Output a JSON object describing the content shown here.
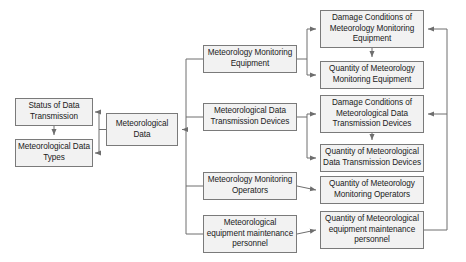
{
  "diagram": {
    "type": "hierarchical-flowchart",
    "colors": {
      "node_fill": "#f2f2f2",
      "node_border": "#7a7a7a",
      "connector": "#6e6e6e",
      "text": "#1a1a1a",
      "background": "#ffffff"
    },
    "nodes": {
      "status_of_data_transmission": {
        "label": "Status of Data Transmission",
        "column": "left-detail",
        "x": 15,
        "y": 98,
        "w": 78,
        "h": 28
      },
      "meteorological_data_types": {
        "label": "Meteorological Data Types",
        "column": "left-detail",
        "x": 15,
        "y": 139,
        "w": 78,
        "h": 28
      },
      "meteorological_data": {
        "label": "Meteorological Data",
        "column": "root",
        "x": 106,
        "y": 113,
        "w": 72,
        "h": 33
      },
      "meteorology_monitoring_equipment": {
        "label": "Meteorology Monitoring Equipment",
        "column": "category",
        "x": 203,
        "y": 45,
        "w": 94,
        "h": 28
      },
      "meteorological_data_transmission_devices": {
        "label": "Meteorological Data Transmission Devices",
        "column": "category",
        "x": 203,
        "y": 103,
        "w": 94,
        "h": 28
      },
      "meteorology_monitoring_operators": {
        "label": "Meteorology Monitoring Operators",
        "column": "category",
        "x": 203,
        "y": 172,
        "w": 94,
        "h": 28
      },
      "meteorological_equipment_maintenance_personnel": {
        "label": "Meteorological equipment maintenance personnel",
        "column": "category",
        "x": 203,
        "y": 215,
        "w": 94,
        "h": 38
      },
      "damage_conditions_of_meteorology_monitoring_equipment": {
        "label": "Damage Conditions of Meteorology Monitoring Equipment",
        "column": "attribute",
        "x": 320,
        "y": 10,
        "w": 104,
        "h": 38
      },
      "quantity_of_meteorology_monitoring_equipment": {
        "label": "Quantity of Meteorology Monitoring Equipment",
        "column": "attribute",
        "x": 320,
        "y": 61,
        "w": 104,
        "h": 28
      },
      "damage_conditions_of_meteorological_data_transmission_devices": {
        "label": "Damage Conditions of Meteorological Data Transmission Devices",
        "column": "attribute",
        "x": 320,
        "y": 95,
        "w": 104,
        "h": 38
      },
      "quantity_of_meteorological_data_transmission_devices": {
        "label": "Quantity of Meteorological Data Transmission Devices",
        "column": "attribute",
        "x": 320,
        "y": 144,
        "w": 104,
        "h": 28
      },
      "quantity_of_meteorology_monitoring_operators": {
        "label": "Quantity of Meteorology Monitoring Operators",
        "column": "attribute",
        "x": 320,
        "y": 176,
        "w": 104,
        "h": 28
      },
      "quantity_of_meteorological_equipment_maintenance_personnel": {
        "label": "Quantity of Meteorological equipment maintenance personnel",
        "column": "attribute",
        "x": 320,
        "y": 211,
        "w": 104,
        "h": 38
      }
    },
    "edges": [
      {
        "from": "meteorological_data",
        "to": "status_of_data_transmission",
        "style": "orthogonal-arrow"
      },
      {
        "from": "meteorological_data",
        "to": "meteorological_data_types",
        "style": "orthogonal-arrow"
      },
      {
        "from": "status_of_data_transmission",
        "to": "meteorological_data_types",
        "style": "vertical-arrow"
      },
      {
        "from": "meteorology_monitoring_equipment",
        "to": "meteorological_data",
        "style": "spine-arrow"
      },
      {
        "from": "meteorological_data_transmission_devices",
        "to": "meteorological_data",
        "style": "spine-arrow"
      },
      {
        "from": "meteorology_monitoring_operators",
        "to": "meteorological_data",
        "style": "spine-arrow"
      },
      {
        "from": "meteorological_equipment_maintenance_personnel",
        "to": "meteorological_data",
        "style": "spine-arrow"
      },
      {
        "from": "meteorology_monitoring_equipment",
        "to": "damage_conditions_of_meteorology_monitoring_equipment",
        "style": "branch-arrow"
      },
      {
        "from": "meteorology_monitoring_equipment",
        "to": "quantity_of_meteorology_monitoring_equipment",
        "style": "branch-arrow"
      },
      {
        "from": "meteorological_data_transmission_devices",
        "to": "damage_conditions_of_meteorological_data_transmission_devices",
        "style": "branch-arrow"
      },
      {
        "from": "meteorological_data_transmission_devices",
        "to": "quantity_of_meteorological_data_transmission_devices",
        "style": "branch-arrow"
      },
      {
        "from": "meteorology_monitoring_operators",
        "to": "quantity_of_meteorology_monitoring_operators",
        "style": "direct-arrow"
      },
      {
        "from": "meteorological_equipment_maintenance_personnel",
        "to": "quantity_of_meteorological_equipment_maintenance_personnel",
        "style": "direct-arrow"
      },
      {
        "from": "damage_conditions_of_meteorology_monitoring_equipment",
        "to": "quantity_of_meteorology_monitoring_equipment",
        "style": "vertical-arrow"
      },
      {
        "from": "damage_conditions_of_meteorological_data_transmission_devices",
        "to": "quantity_of_meteorological_data_transmission_devices",
        "style": "vertical-arrow"
      },
      {
        "from": "quantity_of_meteorological_equipment_maintenance_personnel",
        "to": "damage_conditions_of_meteorology_monitoring_equipment",
        "style": "right-feedback-arrow"
      },
      {
        "from": "quantity_of_meteorological_equipment_maintenance_personnel",
        "to": "damage_conditions_of_meteorological_data_transmission_devices",
        "style": "right-feedback-arrow"
      }
    ]
  }
}
